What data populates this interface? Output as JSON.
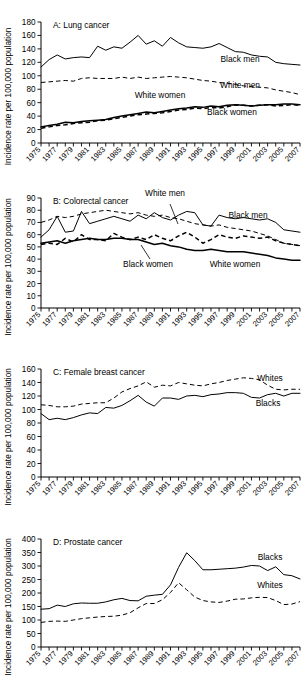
{
  "figure": {
    "ylabel": "Incidence rate per 100,000 population",
    "xtick_labels": [
      "1975",
      "1977",
      "1979",
      "1981",
      "1983",
      "1985",
      "1987",
      "1989",
      "1991",
      "1993",
      "1995",
      "1997",
      "1999",
      "2001",
      "2003",
      "2005",
      "2007"
    ],
    "years_all": [
      1975,
      1976,
      1977,
      1978,
      1979,
      1980,
      1981,
      1982,
      1983,
      1984,
      1985,
      1986,
      1987,
      1988,
      1989,
      1990,
      1991,
      1992,
      1993,
      1994,
      1995,
      1996,
      1997,
      1998,
      1999,
      2000,
      2001,
      2002,
      2003,
      2004,
      2005,
      2006,
      2007
    ]
  },
  "chart_data": [
    {
      "type": "line",
      "panel": "A",
      "title": "A: Lung cancer",
      "xlabel": "",
      "ylabel": "Incidence rate per 100,000 population",
      "xlim": [
        1975,
        2007
      ],
      "ylim": [
        0,
        180
      ],
      "yticks": [
        0,
        20,
        40,
        60,
        80,
        100,
        120,
        140,
        160,
        180
      ],
      "grid": false,
      "legend": "inline-labels",
      "x": [
        1975,
        1976,
        1977,
        1978,
        1979,
        1980,
        1981,
        1982,
        1983,
        1984,
        1985,
        1986,
        1987,
        1988,
        1989,
        1990,
        1991,
        1992,
        1993,
        1994,
        1995,
        1996,
        1997,
        1998,
        1999,
        2000,
        2001,
        2002,
        2003,
        2004,
        2005,
        2006,
        2007
      ],
      "series": [
        {
          "name": "Black men",
          "style": "solid",
          "values": [
            113,
            124,
            131,
            125,
            127,
            128,
            127,
            144,
            138,
            143,
            141,
            150,
            160,
            147,
            152,
            144,
            157,
            149,
            143,
            142,
            141,
            143,
            148,
            142,
            136,
            135,
            131,
            129,
            128,
            120,
            118,
            117,
            116,
            112
          ]
        },
        {
          "name": "White men",
          "style": "dashed",
          "values": [
            90,
            91,
            92,
            93,
            92,
            96,
            97,
            96,
            96,
            96,
            98,
            96,
            98,
            96,
            97,
            98,
            99,
            98,
            97,
            95,
            93,
            92,
            90,
            89,
            87,
            85,
            84,
            83,
            82,
            79,
            77,
            75,
            72
          ]
        },
        {
          "name": "White women",
          "style": "solid-thick",
          "values": [
            24,
            26,
            28,
            31,
            30,
            32,
            33,
            34,
            35,
            38,
            40,
            42,
            44,
            46,
            45,
            47,
            49,
            51,
            52,
            54,
            53,
            55,
            54,
            56,
            57,
            56,
            55,
            56,
            57,
            57,
            58,
            58,
            57
          ]
        },
        {
          "name": "Black women",
          "style": "dashed-thick",
          "values": [
            22,
            24,
            26,
            27,
            29,
            30,
            31,
            33,
            34,
            36,
            38,
            40,
            42,
            43,
            44,
            45,
            47,
            49,
            50,
            52,
            51,
            53,
            52,
            54,
            57,
            56,
            55,
            56,
            57,
            55,
            56,
            57,
            56
          ]
        }
      ]
    },
    {
      "type": "line",
      "panel": "B",
      "title": "B: Colorectal cancer",
      "xlabel": "",
      "ylabel": "Incidence rate per 100,000 population",
      "xlim": [
        1975,
        2007
      ],
      "ylim": [
        0,
        90
      ],
      "yticks": [
        0,
        10,
        20,
        30,
        40,
        50,
        60,
        70,
        80,
        90
      ],
      "grid": false,
      "legend": "inline-labels",
      "x": [
        1975,
        1976,
        1977,
        1978,
        1979,
        1980,
        1981,
        1982,
        1983,
        1984,
        1985,
        1986,
        1987,
        1988,
        1989,
        1990,
        1991,
        1992,
        1993,
        1994,
        1995,
        1996,
        1997,
        1998,
        1999,
        2000,
        2001,
        2002,
        2003,
        2004,
        2005,
        2006,
        2007
      ],
      "series": [
        {
          "name": "Black men",
          "style": "solid",
          "values": [
            58,
            64,
            75,
            62,
            63,
            79,
            69,
            71,
            73,
            75,
            73,
            71,
            76,
            73,
            78,
            74,
            72,
            76,
            79,
            78,
            68,
            67,
            76,
            74,
            73,
            74,
            73,
            72,
            73,
            70,
            64,
            63,
            62
          ]
        },
        {
          "name": "White men",
          "style": "dashed",
          "values": [
            70,
            72,
            75,
            74,
            75,
            77,
            78,
            79,
            80,
            79,
            78,
            77,
            78,
            76,
            75,
            76,
            74,
            73,
            71,
            69,
            68,
            67,
            68,
            66,
            65,
            64,
            63,
            61,
            59,
            56,
            53,
            52,
            51
          ]
        },
        {
          "name": "White women",
          "style": "solid-thick",
          "values": [
            53,
            54,
            55,
            53,
            55,
            56,
            57,
            56,
            56,
            57,
            57,
            56,
            56,
            54,
            52,
            53,
            51,
            50,
            48,
            47,
            47,
            48,
            47,
            46,
            46,
            46,
            45,
            44,
            43,
            41,
            40,
            39,
            39
          ]
        },
        {
          "name": "Black women",
          "style": "dashed-thick",
          "values": [
            52,
            53,
            52,
            57,
            54,
            60,
            56,
            56,
            55,
            61,
            58,
            56,
            58,
            56,
            60,
            57,
            55,
            59,
            62,
            58,
            53,
            56,
            60,
            58,
            57,
            59,
            58,
            57,
            58,
            55,
            53,
            52,
            51
          ]
        }
      ]
    },
    {
      "type": "line",
      "panel": "C",
      "title": "C: Female breast cancer",
      "xlabel": "",
      "ylabel": "Incidence rate per 100,000 population",
      "xlim": [
        1975,
        2007
      ],
      "ylim": [
        0,
        160
      ],
      "yticks": [
        0,
        20,
        40,
        60,
        80,
        100,
        120,
        140,
        160
      ],
      "grid": false,
      "legend": "inline-labels",
      "x": [
        1975,
        1976,
        1977,
        1978,
        1979,
        1980,
        1981,
        1982,
        1983,
        1984,
        1985,
        1986,
        1987,
        1988,
        1989,
        1990,
        1991,
        1992,
        1993,
        1994,
        1995,
        1996,
        1997,
        1998,
        1999,
        2000,
        2001,
        2002,
        2003,
        2004,
        2005,
        2006,
        2007
      ],
      "series": [
        {
          "name": "Whites",
          "style": "dashed",
          "values": [
            107,
            106,
            104,
            104,
            105,
            108,
            109,
            110,
            110,
            117,
            126,
            131,
            135,
            141,
            133,
            136,
            135,
            140,
            138,
            136,
            135,
            138,
            140,
            143,
            145,
            147,
            146,
            144,
            136,
            130,
            129,
            130,
            130
          ]
        },
        {
          "name": "Blacks",
          "style": "solid",
          "values": [
            94,
            85,
            87,
            85,
            88,
            92,
            95,
            94,
            103,
            102,
            106,
            113,
            121,
            111,
            105,
            117,
            117,
            115,
            120,
            121,
            119,
            122,
            123,
            125,
            125,
            124,
            118,
            117,
            122,
            124,
            120,
            124,
            124
          ]
        }
      ]
    },
    {
      "type": "line",
      "panel": "D",
      "title": "D: Prostate cancer",
      "xlabel": "",
      "ylabel": "Incidence rate per 100,000 population",
      "xlim": [
        1975,
        2007
      ],
      "ylim": [
        0,
        400
      ],
      "yticks": [
        0,
        50,
        100,
        150,
        200,
        250,
        300,
        350,
        400
      ],
      "grid": false,
      "legend": "inline-labels",
      "x": [
        1975,
        1976,
        1977,
        1978,
        1979,
        1980,
        1981,
        1982,
        1983,
        1984,
        1985,
        1986,
        1987,
        1988,
        1989,
        1990,
        1991,
        1992,
        1993,
        1994,
        1995,
        1996,
        1997,
        1998,
        1999,
        2000,
        2001,
        2002,
        2003,
        2004,
        2005,
        2006,
        2007
      ],
      "series": [
        {
          "name": "Blacks",
          "style": "solid",
          "values": [
            140,
            142,
            155,
            150,
            160,
            163,
            162,
            162,
            167,
            175,
            180,
            172,
            171,
            188,
            192,
            195,
            230,
            295,
            349,
            320,
            286,
            286,
            288,
            290,
            292,
            296,
            302,
            300,
            283,
            297,
            268,
            264,
            252,
            264
          ]
        },
        {
          "name": "Whites",
          "style": "dashed",
          "values": [
            91,
            95,
            96,
            95,
            100,
            105,
            108,
            111,
            113,
            114,
            118,
            127,
            145,
            161,
            161,
            175,
            202,
            238,
            212,
            185,
            172,
            167,
            165,
            170,
            177,
            178,
            182,
            184,
            183,
            172,
            157,
            159,
            168
          ]
        }
      ]
    }
  ],
  "annotations": {
    "A": [
      {
        "label": "Black men",
        "x": 240,
        "y": 62
      },
      {
        "label": "White men",
        "x": 240,
        "y": 88
      },
      {
        "label": "White women",
        "x": 160,
        "y": 98
      },
      {
        "label": "Black women",
        "x": 232,
        "y": 115
      }
    ],
    "B": [
      {
        "label": "White men",
        "x": 165,
        "y": 196
      },
      {
        "label": "Black men",
        "x": 248,
        "y": 218
      },
      {
        "label": "Black women",
        "x": 148,
        "y": 267
      },
      {
        "label": "White women",
        "x": 235,
        "y": 267
      }
    ],
    "C": [
      {
        "label": "Whites",
        "x": 270,
        "y": 381
      },
      {
        "label": "Blacks",
        "x": 268,
        "y": 406
      }
    ],
    "D": [
      {
        "label": "Blacks",
        "x": 270,
        "y": 560
      },
      {
        "label": "Whites",
        "x": 270,
        "y": 588
      }
    ]
  }
}
